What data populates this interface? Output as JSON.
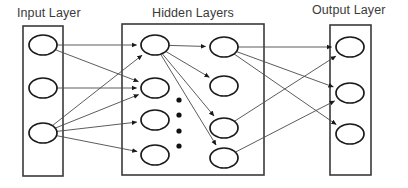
{
  "diagram": {
    "kind": "neural-network-architecture",
    "background_color": "#ffffff",
    "stroke_color": "#4a4a4a",
    "node_stroke_color": "#1a1a1a",
    "text_color": "#3a3a3a",
    "titles": {
      "input": "Input Layer",
      "hidden": "Hidden Layers",
      "output": "Output Layer"
    },
    "boxes": [
      {
        "name": "input-layer-box",
        "x": 23,
        "y": 26,
        "width": 40,
        "height": 150
      },
      {
        "name": "hidden-layer-box",
        "x": 122,
        "y": 24,
        "width": 142,
        "height": 151
      },
      {
        "name": "output-layer-box",
        "x": 330,
        "y": 25,
        "width": 41,
        "height": 150
      }
    ],
    "node_rx": 14,
    "node_ry": 10,
    "layers": [
      {
        "id": "input",
        "label": "Input Layer",
        "node_count": 3,
        "nodes": [
          {
            "id": "i1",
            "cx": 43,
            "cy": 45
          },
          {
            "id": "i2",
            "cx": 43,
            "cy": 88
          },
          {
            "id": "i3",
            "cx": 43,
            "cy": 133
          }
        ]
      },
      {
        "id": "hidden1",
        "label": "Hidden Layer 1",
        "node_count": 4,
        "nodes": [
          {
            "id": "h1a",
            "cx": 155,
            "cy": 45
          },
          {
            "id": "h1b",
            "cx": 155,
            "cy": 88
          },
          {
            "id": "h1c",
            "cx": 155,
            "cy": 120
          },
          {
            "id": "h1d",
            "cx": 155,
            "cy": 155
          }
        ]
      },
      {
        "id": "hidden2",
        "label": "Hidden Layer 2",
        "node_count": 4,
        "nodes": [
          {
            "id": "h2a",
            "cx": 224,
            "cy": 47
          },
          {
            "id": "h2b",
            "cx": 224,
            "cy": 86
          },
          {
            "id": "h2c",
            "cx": 224,
            "cy": 128
          },
          {
            "id": "h2d",
            "cx": 224,
            "cy": 158
          }
        ]
      },
      {
        "id": "output",
        "label": "Output Layer",
        "node_count": 3,
        "nodes": [
          {
            "id": "o1",
            "cx": 350,
            "cy": 47
          },
          {
            "id": "o2",
            "cx": 350,
            "cy": 93
          },
          {
            "id": "o3",
            "cx": 350,
            "cy": 134
          }
        ]
      }
    ],
    "ellipsis_dots": {
      "name": "vertical-ellipsis",
      "cx": 179,
      "radius": 2.6,
      "cy_values": [
        100,
        115,
        131,
        146
      ]
    },
    "edges": [
      {
        "from": "i1",
        "to": "h1a"
      },
      {
        "from": "i1",
        "to": "h1b"
      },
      {
        "from": "i2",
        "to": "h1b"
      },
      {
        "from": "i3",
        "to": "h1a"
      },
      {
        "from": "i3",
        "to": "h1b"
      },
      {
        "from": "i3",
        "to": "h1c"
      },
      {
        "from": "i3",
        "to": "h1d"
      },
      {
        "from": "h1a",
        "to": "h2a"
      },
      {
        "from": "h1a",
        "to": "h2b"
      },
      {
        "from": "h1a",
        "to": "h2c"
      },
      {
        "from": "h1a",
        "to": "h2d"
      },
      {
        "from": "h2a",
        "to": "o1"
      },
      {
        "from": "h2a",
        "to": "o2"
      },
      {
        "from": "h2a",
        "to": "o3"
      },
      {
        "from": "h2c",
        "to": "o1"
      },
      {
        "from": "h2d",
        "to": "o2"
      }
    ]
  }
}
